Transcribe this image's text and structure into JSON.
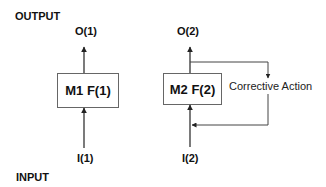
{
  "diagram": {
    "output_label": "OUTPUT",
    "input_label": "INPUT",
    "model1": {
      "box_label": "M1 F(1)",
      "output": "O(1)",
      "input": "I(1)"
    },
    "model2": {
      "box_label": "M2 F(2)",
      "output": "O(2)",
      "input": "I(2)",
      "feedback_label": "Corrective Action"
    },
    "colors": {
      "line": "#222222",
      "box_border": "#555555",
      "text": "#111111"
    }
  }
}
